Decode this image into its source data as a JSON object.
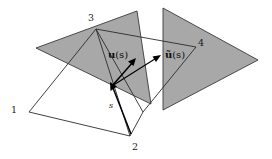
{
  "figure": {
    "background_color": "#ffffff",
    "face_fill_color": "#a8a8a8",
    "edge_color": "#2b2b2b",
    "arrow_color": "#000000",
    "labels": {
      "vertex_1": "1",
      "vertex_2": "2",
      "vertex_3": "3",
      "vertex_4": "4",
      "vector_u": "u",
      "vector_u_arg": "(s)",
      "vector_u_tilde": "ũ",
      "vector_u_tilde_arg": "(s)",
      "point_s": "s"
    }
  }
}
